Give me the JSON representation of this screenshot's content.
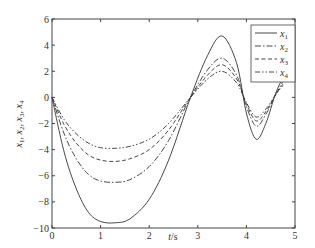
{
  "chart_data": {
    "type": "line",
    "title": "",
    "xlabel": "t/s",
    "ylabel": "x1, x2, x3, x4",
    "xlim": [
      0,
      5
    ],
    "ylim": [
      -10,
      6
    ],
    "xticks": [
      0,
      1,
      2,
      3,
      4,
      5
    ],
    "yticks": [
      -10,
      -8,
      -6,
      -4,
      -2,
      0,
      2,
      4,
      6
    ],
    "grid": false,
    "legend_position": "upper right",
    "x": [
      0,
      0.25,
      0.5,
      0.75,
      1.0,
      1.3,
      1.6,
      2.0,
      2.4,
      2.85,
      3.2,
      3.5,
      3.8,
      4.0,
      4.2,
      4.4,
      4.6,
      4.75
    ],
    "series": [
      {
        "name": "x1",
        "style": "solid",
        "values": [
          0,
          -4.2,
          -7.0,
          -8.8,
          -9.5,
          -9.6,
          -9.3,
          -7.8,
          -4.8,
          0,
          3.2,
          4.7,
          2.6,
          -1.2,
          -3.2,
          -2.0,
          0.3,
          1.5
        ]
      },
      {
        "name": "x2",
        "style": "dashdot",
        "values": [
          0,
          -2.8,
          -4.7,
          -5.9,
          -6.4,
          -6.5,
          -6.3,
          -5.3,
          -3.3,
          0,
          2.1,
          3.0,
          1.7,
          -0.7,
          -2.2,
          -1.3,
          0.2,
          1.2
        ]
      },
      {
        "name": "x3",
        "style": "dashed",
        "values": [
          0,
          -2.1,
          -3.5,
          -4.4,
          -4.8,
          -4.9,
          -4.7,
          -4.0,
          -2.5,
          0,
          1.7,
          2.5,
          1.4,
          -0.5,
          -1.8,
          -1.1,
          0.2,
          1.0
        ]
      },
      {
        "name": "x4",
        "style": "dashdotdot",
        "values": [
          0,
          -1.7,
          -2.8,
          -3.5,
          -3.85,
          -3.9,
          -3.75,
          -3.2,
          -2.0,
          0,
          1.4,
          2.0,
          1.1,
          -0.4,
          -1.5,
          -0.9,
          0.2,
          0.9
        ]
      }
    ]
  },
  "legend": {
    "items": [
      {
        "label": "x",
        "sub": "1"
      },
      {
        "label": "x",
        "sub": "2"
      },
      {
        "label": "x",
        "sub": "3"
      },
      {
        "label": "x",
        "sub": "4"
      }
    ]
  },
  "axes": {
    "xlabel_italic": "t",
    "xlabel_unit": "/s",
    "ylabel": "x1, x2, x3, x4"
  }
}
